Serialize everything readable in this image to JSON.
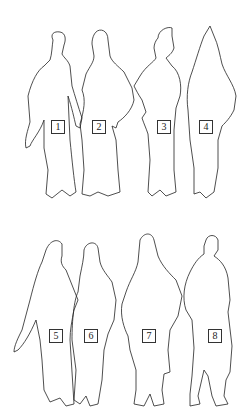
{
  "figure": {
    "groups": [
      {
        "name": "top-row",
        "figures": [
          {
            "label": "1",
            "x": 51,
            "y": 120
          },
          {
            "label": "2",
            "x": 92,
            "y": 120
          },
          {
            "label": "3",
            "x": 157,
            "y": 120
          },
          {
            "label": "4",
            "x": 199,
            "y": 120
          }
        ]
      },
      {
        "name": "bottom-row",
        "figures": [
          {
            "label": "5",
            "x": 49,
            "y": 329
          },
          {
            "label": "6",
            "x": 84,
            "y": 329
          },
          {
            "label": "7",
            "x": 142,
            "y": 329
          },
          {
            "label": "8",
            "x": 208,
            "y": 329
          }
        ]
      }
    ],
    "stroke_color": "#222222",
    "background": "#ffffff"
  }
}
